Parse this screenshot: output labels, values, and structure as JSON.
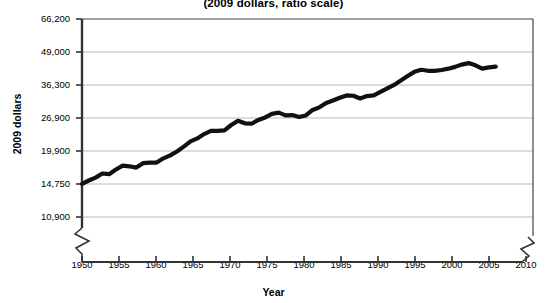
{
  "chart_data": {
    "type": "line",
    "title": "(2009 dollars, ratio scale)",
    "subtitle": "(2009 dollars, ratio scale)",
    "xlabel": "Year",
    "ylabel": "2009 dollars",
    "scale": "log",
    "grid": true,
    "legend": null,
    "axis_break_y": true,
    "axis_break_x": true,
    "ylim": [
      10900,
      66200
    ],
    "xlim": [
      1950,
      2011
    ],
    "ytick_labels": [
      "66,200",
      "49,000",
      "36,300",
      "26,900",
      "19,900",
      "14,750",
      "10,900"
    ],
    "ytick_values": [
      66200,
      49000,
      36300,
      26900,
      19900,
      14750,
      10900
    ],
    "xtick_labels": [
      "1950",
      "1955",
      "1960",
      "1965",
      "1970",
      "1975",
      "1980",
      "1985",
      "1990",
      "1995",
      "2000",
      "2005",
      "2010"
    ],
    "xtick_values": [
      1950,
      1955,
      1960,
      1965,
      1970,
      1975,
      1980,
      1985,
      1990,
      1995,
      2000,
      2005,
      2010
    ],
    "line_color": "#111111",
    "x": [
      1950,
      1951,
      1952,
      1953,
      1954,
      1955,
      1956,
      1957,
      1958,
      1959,
      1960,
      1961,
      1962,
      1963,
      1964,
      1965,
      1966,
      1967,
      1968,
      1969,
      1970,
      1971,
      1972,
      1973,
      1974,
      1975,
      1976,
      1977,
      1978,
      1979,
      1980,
      1981,
      1982,
      1983,
      1984,
      1985,
      1986,
      1987,
      1988,
      1989,
      1990,
      1991,
      1992,
      1993,
      1994,
      1995,
      1996,
      1997,
      1998,
      1999,
      2000,
      2001,
      2002,
      2003,
      2004,
      2005,
      2006,
      2007,
      2008,
      2009,
      2010,
      2011
    ],
    "values": [
      14600,
      15000,
      15300,
      15900,
      15800,
      16400,
      16900,
      16800,
      16600,
      17200,
      17300,
      17300,
      17900,
      18300,
      18900,
      19700,
      20600,
      21100,
      21900,
      22500,
      22500,
      22600,
      23600,
      24500,
      24000,
      23900,
      24700,
      25200,
      26000,
      26200,
      25700,
      25800,
      25400,
      25700,
      26900,
      27500,
      28500,
      29100,
      29800,
      30400,
      30300,
      29600,
      30200,
      30400,
      31300,
      32200,
      33100,
      34300,
      35600,
      36800,
      37400,
      37100,
      37100,
      37300,
      37700,
      38200,
      38900,
      39300,
      38700,
      37700,
      38000,
      38200
    ],
    "values_note": "Estimated from the ratio (log) y-axis; axis gridlines at 10,900 / 14,750 / 19,900 / 26,900 / 36,300 / 49,000 / 66,200",
    "plot_values_dollars": [
      14750,
      15200,
      15600,
      16200,
      16100,
      16800,
      17400,
      17300,
      17100,
      17800,
      17900,
      17900,
      18600,
      19100,
      19800,
      20700,
      21700,
      22300,
      23200,
      23900,
      23900,
      24000,
      25200,
      26200,
      25600,
      25500,
      26400,
      27000,
      27900,
      28200,
      27500,
      27600,
      27100,
      27500,
      28900,
      29600,
      30800,
      31500,
      32300,
      33000,
      32900,
      32100,
      32800,
      33000,
      34100,
      35200,
      36300,
      37800,
      39400,
      40900,
      41700,
      41300,
      41300,
      41600,
      42100,
      42800,
      43700,
      44300,
      43400,
      42100,
      42600,
      42900
    ]
  }
}
